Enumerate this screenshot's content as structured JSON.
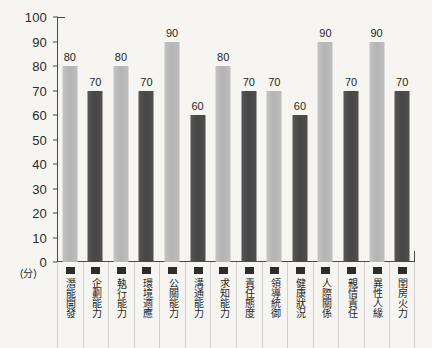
{
  "chart_data": {
    "type": "bar",
    "title": "",
    "xlabel": "",
    "ylabel": "(分)",
    "ylim": [
      0,
      100
    ],
    "grid": false,
    "legend": "none",
    "y_ticks": [
      100,
      90,
      80,
      70,
      60,
      50,
      40,
      30,
      20,
      10,
      0
    ],
    "categories": [
      "潛能開發",
      "企劃能力",
      "執行能力",
      "環境適應",
      "公關能力",
      "溝通能力",
      "求知能力",
      "責任態度",
      "領導統御",
      "健康狀況",
      "人際關係",
      "親情責任",
      "異性人緣",
      "閨房火力"
    ],
    "values": [
      80,
      70,
      80,
      70,
      90,
      60,
      80,
      70,
      70,
      60,
      90,
      70,
      90,
      70
    ],
    "bar_colors": [
      "#b8b8b8",
      "#4a4a4a",
      "#b8b8b8",
      "#4a4a4a",
      "#b8b8b8",
      "#4a4a4a",
      "#b8b8b8",
      "#4a4a4a",
      "#b8b8b8",
      "#4a4a4a",
      "#b8b8b8",
      "#4a4a4a",
      "#b8b8b8",
      "#4a4a4a"
    ]
  },
  "colors": {
    "background": "#f6f5f2",
    "axis": "#4a4a4a",
    "light_bar": "#b8b8b8",
    "dark_bar": "#4a4a4a",
    "text": "#1f1f1f",
    "cell_divider": "#cfcfcb",
    "legend_swatch": "#2c2c2c"
  }
}
